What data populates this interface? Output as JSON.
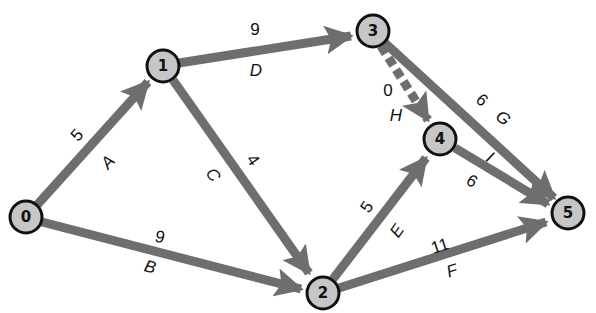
{
  "diagram": {
    "type": "activity-on-arrow network",
    "edge_color": "#6e6e6e",
    "node_fill": "#c6c6c6",
    "node_stroke": "#111111",
    "nodes": [
      {
        "id": "0",
        "label": "0",
        "x": 26,
        "y": 217
      },
      {
        "id": "1",
        "label": "1",
        "x": 163,
        "y": 66
      },
      {
        "id": "2",
        "label": "2",
        "x": 323,
        "y": 293
      },
      {
        "id": "3",
        "label": "3",
        "x": 373,
        "y": 31
      },
      {
        "id": "4",
        "label": "4",
        "x": 440,
        "y": 139
      },
      {
        "id": "5",
        "label": "5",
        "x": 568,
        "y": 213
      }
    ],
    "edges": [
      {
        "activity": "A",
        "duration": "5",
        "from": "0",
        "to": "1",
        "dashed": false
      },
      {
        "activity": "B",
        "duration": "9",
        "from": "0",
        "to": "2",
        "dashed": false
      },
      {
        "activity": "C",
        "duration": "4",
        "from": "1",
        "to": "2",
        "dashed": false
      },
      {
        "activity": "D",
        "duration": "9",
        "from": "1",
        "to": "3",
        "dashed": false
      },
      {
        "activity": "E",
        "duration": "5",
        "from": "2",
        "to": "4",
        "dashed": false
      },
      {
        "activity": "F",
        "duration": "11",
        "from": "2",
        "to": "5",
        "dashed": false
      },
      {
        "activity": "G",
        "duration": "6",
        "from": "3",
        "to": "5",
        "dashed": false
      },
      {
        "activity": "H",
        "duration": "0",
        "from": "3",
        "to": "4",
        "dashed": true
      },
      {
        "activity": "I",
        "duration": "6",
        "from": "4",
        "to": "5",
        "dashed": false
      }
    ]
  }
}
